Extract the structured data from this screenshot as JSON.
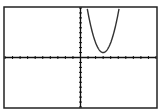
{
  "chart_data": {
    "type": "line",
    "title": "",
    "xlabel": "",
    "ylabel": "",
    "xlim": [
      -10,
      10
    ],
    "ylim": [
      -10,
      10
    ],
    "x_tick_step": 1,
    "y_tick_step": 1,
    "grid": false,
    "series": [
      {
        "name": "Y1",
        "equation": "y = 2(x - 3)^2 + 1",
        "vertex": [
          3,
          1
        ],
        "x": [
          0.9,
          1.5,
          2.0,
          2.5,
          3.0,
          3.5,
          4.0,
          4.5,
          5.1
        ],
        "y": [
          9.8,
          5.5,
          3.0,
          1.5,
          1.0,
          1.5,
          3.0,
          5.5,
          9.8
        ]
      }
    ]
  },
  "colors": {
    "background": "#ffffff",
    "frame": "#222222",
    "axes": "#111111",
    "curve": "#333333"
  }
}
